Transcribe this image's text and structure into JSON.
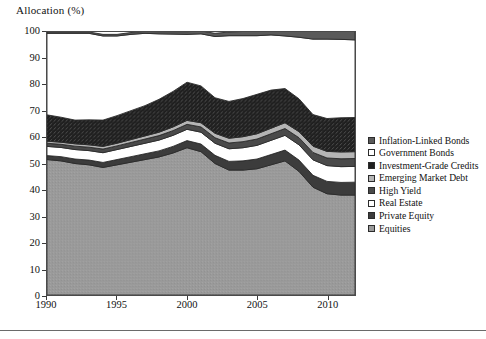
{
  "chart_data": {
    "type": "area",
    "title": "",
    "ylabel": "Allocation (%)",
    "xlabel": "",
    "ylim": [
      0,
      100
    ],
    "xlim": [
      1990,
      2012
    ],
    "yticks": [
      0,
      10,
      20,
      30,
      40,
      50,
      60,
      70,
      80,
      90,
      100
    ],
    "xticks": [
      1990,
      1995,
      2000,
      2005,
      2010
    ],
    "grid": false,
    "stacked": true,
    "legend_position": "right",
    "x": [
      1990,
      1991,
      1992,
      1993,
      1994,
      1995,
      1996,
      1997,
      1998,
      1999,
      2000,
      2001,
      2002,
      2003,
      2004,
      2005,
      2006,
      2007,
      2008,
      2009,
      2010,
      2011,
      2012
    ],
    "series": [
      {
        "name": "Equities",
        "swatch": "#9a9a9a",
        "values": [
          51.5,
          51.0,
          50.0,
          49.5,
          48.5,
          49.5,
          50.5,
          51.5,
          52.5,
          54.0,
          56.0,
          54.5,
          50.0,
          47.5,
          47.5,
          48.0,
          49.5,
          51.0,
          47.0,
          41.0,
          38.5,
          38.0,
          38.0
        ]
      },
      {
        "name": "Private Equity",
        "swatch": "#3c3c3c",
        "values": [
          1.5,
          1.6,
          1.7,
          1.8,
          1.9,
          2.0,
          2.1,
          2.2,
          2.3,
          2.5,
          2.7,
          2.9,
          3.1,
          3.3,
          3.5,
          3.7,
          3.9,
          4.1,
          4.3,
          4.5,
          4.7,
          4.8,
          4.9
        ]
      },
      {
        "name": "Real Estate",
        "swatch": "#ffffff",
        "values": [
          3.5,
          3.5,
          3.6,
          3.6,
          3.7,
          3.8,
          3.9,
          4.0,
          4.1,
          4.2,
          4.3,
          4.5,
          4.6,
          4.8,
          5.0,
          5.2,
          5.4,
          5.6,
          5.8,
          5.9,
          6.0,
          6.0,
          6.0
        ]
      },
      {
        "name": "High Yield",
        "swatch": "#4a4a4a",
        "values": [
          1.2,
          1.2,
          1.3,
          1.3,
          1.4,
          1.4,
          1.5,
          1.6,
          1.7,
          1.8,
          1.9,
          2.0,
          2.1,
          2.2,
          2.3,
          2.4,
          2.5,
          2.6,
          2.7,
          2.8,
          2.9,
          3.0,
          3.0
        ]
      },
      {
        "name": "Emerging Market Debt",
        "swatch": "#b5b5b5",
        "values": [
          0.8,
          0.8,
          0.9,
          0.9,
          1.0,
          1.0,
          1.1,
          1.2,
          1.3,
          1.4,
          1.5,
          1.6,
          1.7,
          1.8,
          1.9,
          2.0,
          2.1,
          2.2,
          2.3,
          2.4,
          2.5,
          2.6,
          2.6
        ]
      },
      {
        "name": "Investment-Grade Credits",
        "swatch": "#1f1f1f",
        "values": [
          10.0,
          9.5,
          9.0,
          9.5,
          10.0,
          10.5,
          11.0,
          11.5,
          12.5,
          13.5,
          14.5,
          14.0,
          13.5,
          14.0,
          14.5,
          15.0,
          14.5,
          13.0,
          12.5,
          12.0,
          12.5,
          13.0,
          13.0
        ]
      },
      {
        "name": "Government Bonds",
        "swatch": "#ffffff",
        "values": [
          31.0,
          31.9,
          33.0,
          32.9,
          32.0,
          30.3,
          29.0,
          27.5,
          24.9,
          21.8,
          18.2,
          19.8,
          23.3,
          25.0,
          23.9,
          22.3,
          21.0,
          20.0,
          23.4,
          28.7,
          30.2,
          29.8,
          29.5
        ]
      },
      {
        "name": "Inflation-Linked Bonds",
        "swatch": "#5a5a5a",
        "values": [
          0.5,
          0.5,
          0.5,
          0.5,
          0.6,
          0.6,
          0.7,
          0.7,
          0.8,
          0.9,
          1.0,
          1.1,
          1.2,
          1.4,
          1.6,
          1.8,
          2.0,
          2.3,
          2.6,
          2.9,
          3.2,
          3.4,
          3.5
        ]
      }
    ]
  },
  "legend": {
    "items": [
      {
        "label": "Inflation-Linked Bonds"
      },
      {
        "label": "Government Bonds"
      },
      {
        "label": "Investment-Grade Credits"
      },
      {
        "label": "Emerging Market Debt"
      },
      {
        "label": "High Yield"
      },
      {
        "label": "Real Estate"
      },
      {
        "label": "Private Equity"
      },
      {
        "label": "Equities"
      }
    ]
  }
}
